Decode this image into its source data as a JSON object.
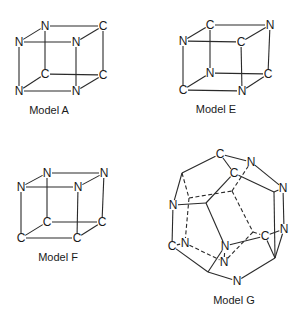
{
  "figure": {
    "models": [
      {
        "id": "A",
        "caption": "Model A",
        "caption_pos": [
          49,
          114
        ],
        "atoms": [
          {
            "label": "N",
            "x": 45,
            "y": 26
          },
          {
            "label": "C",
            "x": 103,
            "y": 26
          },
          {
            "label": "N",
            "x": 19,
            "y": 42
          },
          {
            "label": "N",
            "x": 76,
            "y": 42
          },
          {
            "label": "C",
            "x": 45,
            "y": 74
          },
          {
            "label": "C",
            "x": 103,
            "y": 75
          },
          {
            "label": "N",
            "x": 19,
            "y": 91
          },
          {
            "label": "N",
            "x": 76,
            "y": 91
          }
        ],
        "edges": [
          [
            0,
            1
          ],
          [
            0,
            2
          ],
          [
            1,
            3
          ],
          [
            2,
            3
          ],
          [
            0,
            4
          ],
          [
            1,
            5
          ],
          [
            2,
            6
          ],
          [
            3,
            7
          ],
          [
            4,
            5
          ],
          [
            4,
            6
          ],
          [
            5,
            7
          ],
          [
            6,
            7
          ]
        ],
        "dashed": []
      },
      {
        "id": "E",
        "caption": "Model E",
        "caption_pos": [
          216,
          113
        ],
        "atoms": [
          {
            "label": "C",
            "x": 210,
            "y": 25
          },
          {
            "label": "N",
            "x": 270,
            "y": 25
          },
          {
            "label": "N",
            "x": 183,
            "y": 41
          },
          {
            "label": "C",
            "x": 241,
            "y": 42
          },
          {
            "label": "N",
            "x": 210,
            "y": 73
          },
          {
            "label": "C",
            "x": 268,
            "y": 74
          },
          {
            "label": "C",
            "x": 183,
            "y": 90
          },
          {
            "label": "N",
            "x": 242,
            "y": 91
          }
        ],
        "edges": [
          [
            0,
            1
          ],
          [
            0,
            2
          ],
          [
            1,
            3
          ],
          [
            2,
            3
          ],
          [
            0,
            4
          ],
          [
            1,
            5
          ],
          [
            2,
            6
          ],
          [
            3,
            7
          ],
          [
            4,
            5
          ],
          [
            4,
            6
          ],
          [
            5,
            7
          ],
          [
            6,
            7
          ]
        ],
        "dashed": []
      },
      {
        "id": "F",
        "caption": "Model F",
        "caption_pos": [
          58,
          261
        ],
        "atoms": [
          {
            "label": "N",
            "x": 47,
            "y": 173
          },
          {
            "label": "N",
            "x": 104,
            "y": 173
          },
          {
            "label": "N",
            "x": 21,
            "y": 187
          },
          {
            "label": "N",
            "x": 78,
            "y": 187
          },
          {
            "label": "C",
            "x": 47,
            "y": 222
          },
          {
            "label": "C",
            "x": 102,
            "y": 222
          },
          {
            "label": "C",
            "x": 21,
            "y": 238
          },
          {
            "label": "C",
            "x": 77,
            "y": 238
          }
        ],
        "edges": [
          [
            0,
            1
          ],
          [
            0,
            2
          ],
          [
            1,
            3
          ],
          [
            2,
            3
          ],
          [
            0,
            4
          ],
          [
            1,
            5
          ],
          [
            2,
            6
          ],
          [
            3,
            7
          ],
          [
            4,
            5
          ],
          [
            4,
            6
          ],
          [
            5,
            7
          ],
          [
            6,
            7
          ]
        ],
        "dashed": []
      },
      {
        "id": "G",
        "caption": "Model G",
        "caption_pos": [
          234,
          304
        ],
        "atoms": [
          {
            "label": "C",
            "x": 220,
            "y": 154
          },
          {
            "label": "N",
            "x": 251,
            "y": 162
          },
          {
            "label": "C",
            "x": 234,
            "y": 173
          },
          {
            "label": "N",
            "x": 283,
            "y": 188
          },
          {
            "label": "N",
            "x": 284,
            "y": 229
          },
          {
            "label": "C",
            "x": 265,
            "y": 236
          },
          {
            "label": "N",
            "x": 173,
            "y": 205
          },
          {
            "label": "C",
            "x": 172,
            "y": 246
          },
          {
            "label": "N",
            "x": 185,
            "y": 243
          },
          {
            "label": "N",
            "x": 225,
            "y": 246
          },
          {
            "label": "N",
            "x": 224,
            "y": 262
          },
          {
            "label": "N",
            "x": 237,
            "y": 281
          },
          {
            "label": "",
            "x": 182,
            "y": 173
          },
          {
            "label": "",
            "x": 206,
            "y": 203
          },
          {
            "label": "",
            "x": 274,
            "y": 192
          },
          {
            "label": "",
            "x": 275,
            "y": 258
          },
          {
            "label": "",
            "x": 208,
            "y": 272
          },
          {
            "label": "",
            "x": 189,
            "y": 198
          },
          {
            "label": "",
            "x": 232,
            "y": 191
          },
          {
            "label": "",
            "x": 253,
            "y": 232
          }
        ],
        "edges": [
          [
            0,
            1
          ],
          [
            0,
            2
          ],
          [
            0,
            12
          ],
          [
            1,
            3
          ],
          [
            2,
            14
          ],
          [
            2,
            13
          ],
          [
            3,
            14
          ],
          [
            3,
            4
          ],
          [
            4,
            15
          ],
          [
            14,
            15
          ],
          [
            12,
            6
          ],
          [
            6,
            13
          ],
          [
            6,
            7
          ],
          [
            7,
            16
          ],
          [
            16,
            11
          ],
          [
            11,
            15
          ],
          [
            13,
            9
          ],
          [
            9,
            5
          ],
          [
            5,
            4
          ],
          [
            5,
            15
          ],
          [
            9,
            16
          ]
        ],
        "dashed": [
          [
            12,
            17
          ],
          [
            17,
            18
          ],
          [
            18,
            1
          ],
          [
            17,
            8
          ],
          [
            18,
            19
          ],
          [
            19,
            5
          ],
          [
            19,
            10
          ],
          [
            8,
            10
          ],
          [
            8,
            7
          ],
          [
            10,
            9
          ]
        ]
      }
    ]
  }
}
